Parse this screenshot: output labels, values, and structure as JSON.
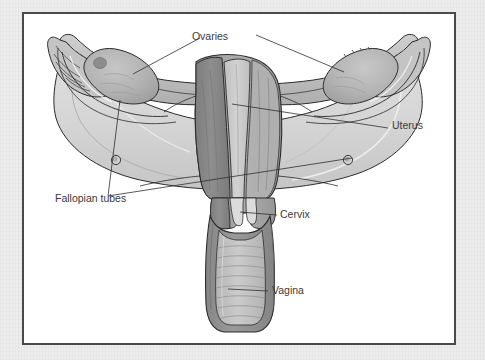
{
  "figure": {
    "frame": {
      "border_color": "#4a4a4a",
      "interior_color": "#ffffff",
      "page_background_color": "#ececec"
    },
    "palette": {
      "outline": "#2b2b2b",
      "broad_ligament": "#d5d5d5",
      "broad_ligament_light": "#e4e4e4",
      "myometrium_dark": "#8b8b8b",
      "myometrium_mid": "#a5a5a5",
      "endometrial_cavity": "#c9c9c9",
      "ovary": "#b4b4b4",
      "ovary_shadow": "#9a9a9a",
      "tube_wall": "#bdbdbd",
      "vagina_wall": "#8f8f8f",
      "vagina_lumen": "#c6c6c6",
      "fimbriae": "#c0c0c0",
      "label_text": "#3a3a3a",
      "leader_line": "#2e2e2e"
    },
    "labels": [
      {
        "id": "ovaries",
        "text": "Ovaries",
        "x": 210,
        "y": 40,
        "anchor": "middle"
      },
      {
        "id": "uterus",
        "text": "Uterus",
        "x": 392,
        "y": 129,
        "anchor": "start"
      },
      {
        "id": "fallopian-tubes",
        "text": "Fallopian tubes",
        "x": 55,
        "y": 202,
        "anchor": "start"
      },
      {
        "id": "cervix",
        "text": "Cervix",
        "x": 280,
        "y": 218,
        "anchor": "start"
      },
      {
        "id": "vagina",
        "text": "Vagina",
        "x": 272,
        "y": 294,
        "anchor": "start"
      }
    ],
    "structures": [
      {
        "id": "left-ovary",
        "name": "Ovaries"
      },
      {
        "id": "right-ovary",
        "name": "Ovaries"
      },
      {
        "id": "left-fallopian-tube",
        "name": "Fallopian tubes"
      },
      {
        "id": "right-fallopian-tube",
        "name": "Fallopian tubes"
      },
      {
        "id": "uterus-body",
        "name": "Uterus"
      },
      {
        "id": "cervix",
        "name": "Cervix"
      },
      {
        "id": "vagina",
        "name": "Vagina"
      },
      {
        "id": "broad-ligament",
        "name": "Broad ligament"
      }
    ]
  }
}
